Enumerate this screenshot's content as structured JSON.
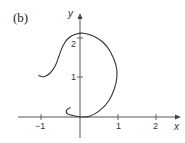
{
  "chart_data": {
    "type": "line",
    "title": "",
    "panel_label": "(b)",
    "xlabel": "x",
    "ylabel": "y",
    "xlim": [
      -1.2,
      2.4
    ],
    "ylim": [
      -0.6,
      2.6
    ],
    "x_ticks": [
      -1,
      1,
      2
    ],
    "x_tick_labels": [
      "−1",
      "1",
      "2"
    ],
    "y_ticks": [
      1,
      2
    ],
    "y_tick_labels": [
      "1",
      "2"
    ],
    "grid": false,
    "legend": null,
    "series": [
      {
        "name": "parametric curve",
        "color": "#333333",
        "points": [
          [
            -1.1,
            1.05
          ],
          [
            -0.95,
            1.02
          ],
          [
            -0.8,
            1.1
          ],
          [
            -0.65,
            1.3
          ],
          [
            -0.55,
            1.55
          ],
          [
            -0.45,
            1.8
          ],
          [
            -0.3,
            2.0
          ],
          [
            -0.1,
            2.1
          ],
          [
            0.1,
            2.12
          ],
          [
            0.35,
            2.05
          ],
          [
            0.6,
            1.9
          ],
          [
            0.8,
            1.65
          ],
          [
            0.95,
            1.3
          ],
          [
            0.97,
            1.0
          ],
          [
            0.9,
            0.7
          ],
          [
            0.75,
            0.4
          ],
          [
            0.5,
            0.15
          ],
          [
            0.25,
            0.02
          ],
          [
            0.05,
            0.0
          ],
          [
            -0.15,
            0.03
          ],
          [
            -0.33,
            0.08
          ],
          [
            -0.35,
            0.18
          ],
          [
            -0.25,
            0.24
          ]
        ]
      }
    ]
  }
}
